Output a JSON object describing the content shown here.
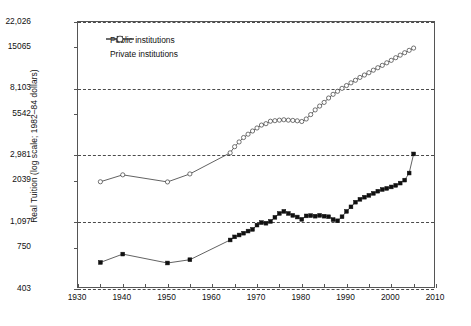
{
  "chart_data": {
    "type": "line",
    "title": "",
    "xlabel": "",
    "ylabel": "Real Tuition (log scale; 1982–84 dollars)",
    "xlim": [
      1930,
      2010
    ],
    "ylim": [
      403,
      22026
    ],
    "yscale": "log",
    "grid": true,
    "gridlines_y": [
      403,
      1097,
      2981,
      8103,
      22026
    ],
    "xticks": [
      1930,
      1935,
      1940,
      1945,
      1950,
      1955,
      1960,
      1965,
      1970,
      1975,
      1980,
      1985,
      1990,
      1995,
      2000,
      2005,
      2010
    ],
    "xtick_labels": [
      "1930",
      "1940",
      "1950",
      "1960",
      "1970",
      "1980",
      "1990",
      "2000",
      "2010"
    ],
    "xtick_label_values": [
      1930,
      1940,
      1950,
      1960,
      1970,
      1980,
      1990,
      2000,
      2010
    ],
    "yticks": [
      403,
      750,
      1097,
      2039,
      2981,
      5542,
      8103,
      15065,
      22026
    ],
    "ytick_labels": [
      "403",
      "750",
      "1,097",
      "2039",
      "2,981",
      "5542",
      "8,103",
      "15065",
      "22,026"
    ],
    "legend_position": "top-left",
    "series": [
      {
        "name": "Public institutions",
        "marker": "filled-square",
        "color": "#111111",
        "x": [
          1935,
          1940,
          1950,
          1955,
          1964,
          1965,
          1966,
          1967,
          1968,
          1969,
          1970,
          1971,
          1972,
          1973,
          1974,
          1975,
          1976,
          1977,
          1978,
          1979,
          1980,
          1981,
          1982,
          1983,
          1984,
          1985,
          1986,
          1987,
          1988,
          1989,
          1990,
          1991,
          1992,
          1993,
          1994,
          1995,
          1996,
          1997,
          1998,
          1999,
          2000,
          2001,
          2002,
          2003,
          2004,
          2005
        ],
        "y": [
          600,
          680,
          595,
          625,
          840,
          880,
          905,
          930,
          960,
          985,
          1050,
          1090,
          1080,
          1110,
          1180,
          1250,
          1290,
          1250,
          1215,
          1185,
          1145,
          1205,
          1210,
          1200,
          1215,
          1200,
          1190,
          1140,
          1120,
          1190,
          1290,
          1380,
          1480,
          1545,
          1595,
          1640,
          1690,
          1745,
          1790,
          1820,
          1860,
          1905,
          1970,
          2060,
          2290,
          3050
        ]
      },
      {
        "name": "Private institutions",
        "marker": "open-circle",
        "color": "#3a3a3a",
        "x": [
          1935,
          1940,
          1950,
          1955,
          1964,
          1965,
          1966,
          1967,
          1968,
          1969,
          1970,
          1971,
          1972,
          1973,
          1974,
          1975,
          1976,
          1977,
          1978,
          1979,
          1980,
          1981,
          1982,
          1983,
          1984,
          1985,
          1986,
          1987,
          1988,
          1989,
          1990,
          1991,
          1992,
          1993,
          1994,
          1995,
          1996,
          1997,
          1998,
          1999,
          2000,
          2001,
          2002,
          2003,
          2004,
          2005
        ],
        "y": [
          2010,
          2230,
          2005,
          2260,
          3100,
          3400,
          3650,
          3900,
          4100,
          4300,
          4500,
          4700,
          4800,
          4980,
          5020,
          5060,
          5090,
          5060,
          5040,
          5010,
          4960,
          5150,
          5500,
          5900,
          6250,
          6600,
          7050,
          7450,
          7800,
          8150,
          8500,
          8850,
          9200,
          9600,
          9950,
          10300,
          10700,
          11100,
          11500,
          11950,
          12400,
          12900,
          13400,
          13900,
          14400,
          14900
        ]
      }
    ]
  },
  "legend": {
    "items": [
      {
        "label": "Public institutions",
        "marker": "filled-square"
      },
      {
        "label": "Private institutions",
        "marker": "open-circle"
      }
    ]
  }
}
